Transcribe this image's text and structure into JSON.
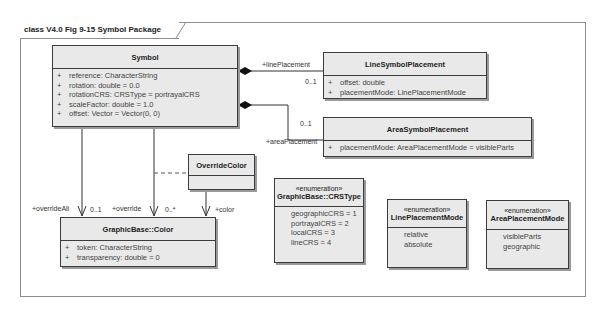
{
  "frame": {
    "title": "class V4.0 Fig 9-15 Symbol Package"
  },
  "classes": {
    "symbol": {
      "name": "Symbol",
      "attributes": [
        {
          "vis": "+",
          "text": "reference:  CharacterString"
        },
        {
          "vis": "+",
          "text": "rotation:  double = 0.0"
        },
        {
          "vis": "+",
          "text": "rotationCRS:  CRSType = portrayalCRS"
        },
        {
          "vis": "+",
          "text": "scaleFactor:  double = 1.0"
        },
        {
          "vis": "+",
          "text": "offset:  Vector = Vector(0, 0)"
        }
      ]
    },
    "line_symbol_placement": {
      "name": "LineSymbolPlacement",
      "attributes": [
        {
          "vis": "+",
          "text": "offset:  double"
        },
        {
          "vis": "+",
          "text": "placementMode:  LinePlacementMode"
        }
      ]
    },
    "area_symbol_placement": {
      "name": "AreaSymbolPlacement",
      "attributes": [
        {
          "vis": "+",
          "text": "placementMode:  AreaPlacementMode = visibleParts"
        }
      ]
    },
    "override_color": {
      "name": "OverrideColor"
    },
    "color": {
      "name": "GraphicBase::Color",
      "attributes": [
        {
          "vis": "+",
          "text": "token:  CharacterString"
        },
        {
          "vis": "+",
          "text": "transparency:  double = 0"
        }
      ]
    },
    "crs_type": {
      "stereotype": "«enumeration»",
      "name": "GraphicBase::CRSType",
      "literals": [
        "geographicCRS = 1",
        "portrayalCRS = 2",
        "localCRS = 3",
        "lineCRS = 4"
      ]
    },
    "line_placement_mode": {
      "stereotype": "«enumeration»",
      "name": "LinePlacementMode",
      "literals": [
        "relative",
        "absolute"
      ]
    },
    "area_placement_mode": {
      "stereotype": "«enumeration»",
      "name": "AreaPlacementMode",
      "literals": [
        "visibleParts",
        "geographic"
      ]
    }
  },
  "associations": {
    "line_placement": {
      "role": "+linePlacement",
      "multiplicity": "0..1"
    },
    "area_placement": {
      "role": "+areaPlacement",
      "multiplicity": "0..1"
    },
    "override_all": {
      "role": "+overrideAll",
      "multiplicity": "0..1"
    },
    "override": {
      "role": "+override",
      "multiplicity": "0..*"
    },
    "color": {
      "role": "+color"
    }
  }
}
